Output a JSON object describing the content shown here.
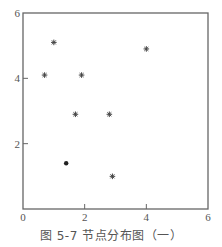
{
  "chart_data": {
    "type": "scatter",
    "title": "",
    "caption": "图 5-7   节点分布图（一）",
    "xlabel": "",
    "ylabel": "",
    "xlim": [
      0,
      6
    ],
    "ylim": [
      0,
      6
    ],
    "grid": false,
    "legend": null,
    "x_ticks": [
      0,
      2,
      4,
      6
    ],
    "y_ticks": [
      2,
      4,
      6
    ],
    "series": [
      {
        "name": "nodes",
        "marker": "asterisk",
        "points": [
          {
            "x": 1.0,
            "y": 5.1
          },
          {
            "x": 0.7,
            "y": 4.1
          },
          {
            "x": 1.9,
            "y": 4.1
          },
          {
            "x": 4.0,
            "y": 4.9
          },
          {
            "x": 1.7,
            "y": 2.9
          },
          {
            "x": 2.8,
            "y": 2.9
          },
          {
            "x": 2.9,
            "y": 1.0
          }
        ]
      },
      {
        "name": "center-node",
        "marker": "dot",
        "points": [
          {
            "x": 1.4,
            "y": 1.4
          }
        ]
      }
    ]
  },
  "colors": {
    "axis": "#666666",
    "marker": "#333333",
    "text": "#555555"
  }
}
